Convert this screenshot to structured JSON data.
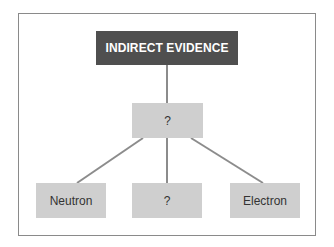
{
  "diagram": {
    "type": "tree",
    "colors": {
      "root_fill": "#4f4f4f",
      "root_text": "#ffffff",
      "node_fill": "#cfcfcf",
      "node_text": "#333333",
      "connector": "#8c8c8c",
      "frame_border": "#8a8a8a"
    },
    "root": {
      "label": "INDIRECT EVIDENCE"
    },
    "middle": {
      "label": "?"
    },
    "leaves": [
      {
        "label": "Neutron"
      },
      {
        "label": "?"
      },
      {
        "label": "Electron"
      }
    ],
    "edges": [
      {
        "from": "INDIRECT EVIDENCE",
        "to": "?"
      },
      {
        "from": "?",
        "to": "Neutron"
      },
      {
        "from": "?",
        "to": "? (leaf)"
      },
      {
        "from": "?",
        "to": "Electron"
      }
    ]
  }
}
